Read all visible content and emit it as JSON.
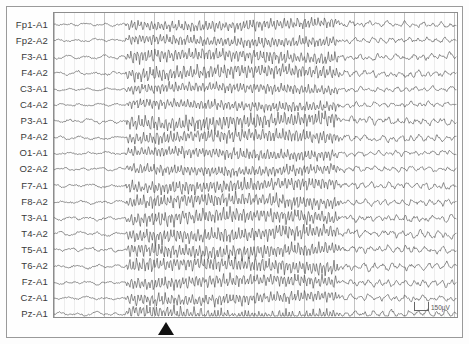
{
  "recording": {
    "type": "EEG",
    "montage": "referential (ear-referenced)",
    "channel_count": 19,
    "channels": [
      "Fp1-A1",
      "Fp2-A2",
      "F3-A1",
      "F4-A2",
      "C3-A1",
      "C4-A2",
      "P3-A1",
      "P4-A2",
      "O1-A1",
      "O2-A2",
      "F7-A1",
      "F8-A2",
      "T3-A1",
      "T4-A2",
      "T5-A1",
      "T6-A2",
      "Fz-A1",
      "Cz-A1",
      "Pz-A1"
    ]
  },
  "calibration": {
    "label": "150µV",
    "amplitude": 150,
    "unit": "µV"
  },
  "event_marker": {
    "name": "seizure-onset-marker",
    "glyph": "filled-up-triangle",
    "x_fraction": 0.279,
    "color": "#111111"
  },
  "grid": {
    "minor_spacing_px": 10,
    "major_every": 5,
    "minor_color": "#dcdcdc",
    "major_color": "#b4b4b4",
    "show": true
  },
  "trace": {
    "color": "#4a4a4a",
    "width": 0.62,
    "row_spacing_px": 16.1,
    "first_row_y_px": 12
  },
  "phases": [
    {
      "name": "pre-ictal baseline",
      "start_fraction": 0.0,
      "end_fraction": 0.178,
      "amplitude": 3.4,
      "frequency": 1.0,
      "roughness": 0.85
    },
    {
      "name": "ictal discharge",
      "start_fraction": 0.178,
      "end_fraction": 0.709,
      "amplitude": 12.6,
      "frequency": 5.6,
      "roughness": 0.35
    },
    {
      "name": "post-ictal",
      "start_fraction": 0.709,
      "end_fraction": 1.0,
      "amplitude": 5.6,
      "frequency": 2.1,
      "roughness": 0.95
    }
  ],
  "colors": {
    "background": "#fdfdfd",
    "panel": "#fefefe",
    "frame": "#8d8d8d",
    "outer_frame": "#9a9a9a",
    "label_text": "#3a3a3a"
  }
}
